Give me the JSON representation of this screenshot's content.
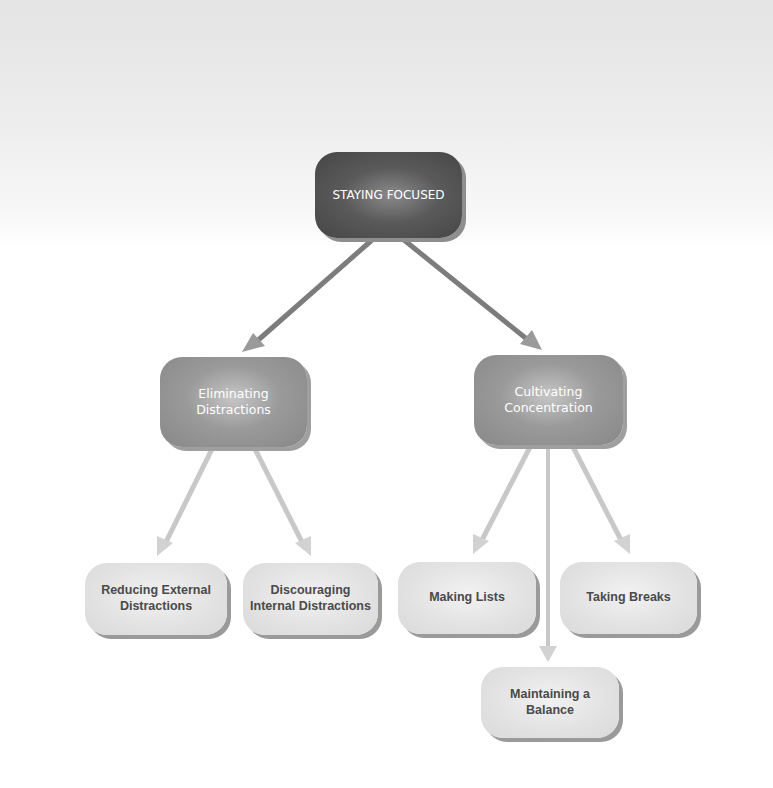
{
  "diagram": {
    "type": "hierarchy",
    "root": {
      "label": "STAYING FOCUSED",
      "children": [
        {
          "label": "Eliminating Distractions",
          "children": [
            {
              "label": "Reducing External Distractions"
            },
            {
              "label": "Discouraging Internal Distractions"
            }
          ]
        },
        {
          "label": "Cultivating Concentration",
          "children": [
            {
              "label": "Making Lists"
            },
            {
              "label": "Maintaining a Balance"
            },
            {
              "label": "Taking Breaks"
            }
          ]
        }
      ]
    }
  },
  "nodes": {
    "root": {
      "line1": "STAYING FOCUSED"
    },
    "eliminating": {
      "line1": "Eliminating",
      "line2": "Distractions"
    },
    "cultivating": {
      "line1": "Cultivating",
      "line2": "Concentration"
    },
    "reducing": {
      "line1": "Reducing External",
      "line2": "Distractions"
    },
    "discouraging": {
      "line1": "Discouraging",
      "line2": "Internal Distractions"
    },
    "making_lists": {
      "line1": "Making Lists"
    },
    "taking_breaks": {
      "line1": "Taking Breaks"
    },
    "maintaining": {
      "line1": "Maintaining a",
      "line2": "Balance"
    }
  },
  "colors": {
    "level0_fill": "#4a4a4a",
    "level1_fill": "#9a9a9a",
    "level2_fill": "#e2e2e2",
    "arrow_dark": "#8a8a8a",
    "arrow_light": "#cfcfcf",
    "text_light": "#ffffff",
    "text_dark": "#4a4a4a"
  }
}
